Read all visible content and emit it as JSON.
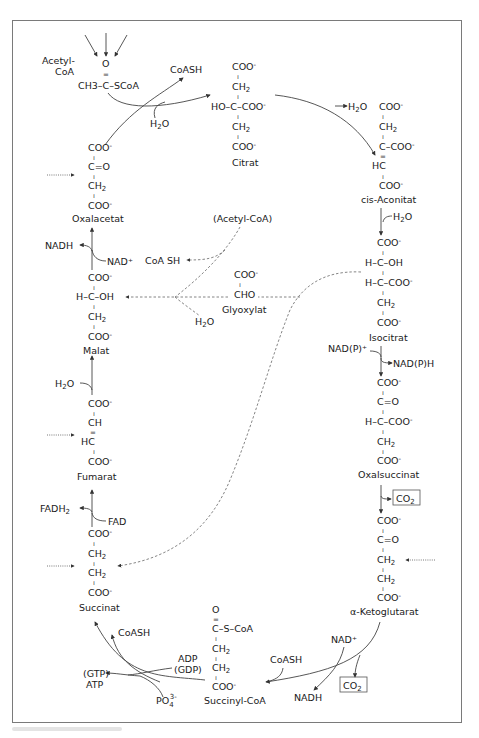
{
  "diagram": {
    "type": "metabolic-pathway",
    "colors": {
      "line": "#444444",
      "frame": "#7a7a7a",
      "text": "#1a1a1a"
    }
  },
  "inputs": {
    "acetyl_coa": {
      "label_line1": "Acetyl-",
      "label_line2": "CoA",
      "o": "O",
      "double_bond": "=",
      "formula": "CH3–C–SCoA"
    },
    "coash_release": "CoASH",
    "water": "H2O"
  },
  "compounds": {
    "citrat": {
      "name": "Citrat",
      "lines": [
        "COO⁻",
        "CH₂",
        "HO–C–COO⁻",
        "CH₂",
        "COO⁻"
      ]
    },
    "cis_aconitat": {
      "name": "cis-Aconitat",
      "lines": [
        "COO⁻",
        "CH₂",
        "C–COO⁻",
        "HC",
        "COO⁻"
      ],
      "water_out": "H₂O"
    },
    "isocitrat": {
      "name": "Isocitrat",
      "lines": [
        "COO⁻",
        "H–C–OH",
        "H–C–COO⁻",
        "CH₂",
        "COO⁻"
      ],
      "water_in": "H₂O"
    },
    "oxalsuccinat": {
      "name": "Oxalsuccinat",
      "lines": [
        "COO⁻",
        "C=O",
        "H–C–COO⁻",
        "CH₂",
        "COO⁻"
      ],
      "cofactor_in": "NAD(P)⁺",
      "cofactor_out": "NAD(P)H"
    },
    "alpha_ketoglutarat": {
      "name": "α-Ketoglutarat",
      "lines": [
        "COO⁻",
        "C=O",
        "CH₂",
        "CH₂",
        "COO⁻"
      ],
      "co2": "CO₂"
    },
    "succinyl_coa": {
      "name": "Succinyl-CoA",
      "lines": [
        "O",
        "C–S–CoA",
        "CH₂",
        "CH₂",
        "COO⁻"
      ],
      "nad": "NAD⁺",
      "nadh": "NADH",
      "coash": "CoASH",
      "co2": "CO₂"
    },
    "succinat": {
      "name": "Succinat",
      "lines": [
        "COO⁻",
        "CH₂",
        "CH₂",
        "COO⁻"
      ],
      "adp": "ADP",
      "gdp": "(GDP)",
      "gtp": "(GTP)",
      "atp": "ATP",
      "phosphate": "PO₄³⁻",
      "coash": "CoASH"
    },
    "fumarat": {
      "name": "Fumarat",
      "lines": [
        "COO⁻",
        "CH",
        "HC",
        "COO⁻"
      ],
      "fad": "FAD",
      "fadh2": "FADH₂"
    },
    "malat": {
      "name": "Malat",
      "lines": [
        "COO⁻",
        "H–C–OH",
        "CH₂",
        "COO⁻"
      ],
      "water_in": "H₂O"
    },
    "oxalacetat": {
      "name": "Oxalacetat",
      "lines": [
        "COO⁻",
        "C=O",
        "CH₂",
        "COO⁻"
      ],
      "nad": "NAD⁺",
      "nadh": "NADH"
    },
    "glyoxylat": {
      "name": "Glyoxylat",
      "lines": [
        "COO⁻",
        "CHO"
      ]
    }
  },
  "glyoxylate_shunt": {
    "acetyl_coa": "(Acetyl-CoA)",
    "coa_sh": "CoA SH",
    "water": "H₂O"
  }
}
